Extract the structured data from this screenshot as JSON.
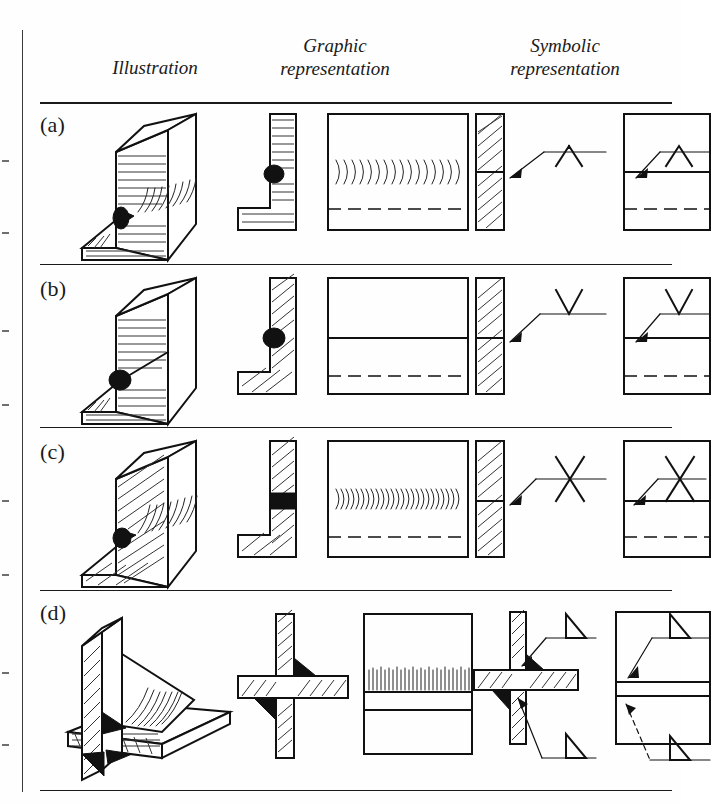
{
  "figure": {
    "kind": "welding-symbols-reference-table",
    "columns": [
      {
        "id": "illustration",
        "line1": "Illustration",
        "line2": ""
      },
      {
        "id": "graphic",
        "line1": "Graphic",
        "line2": "representation"
      },
      {
        "id": "symbolic",
        "line1": "Symbolic",
        "line2": "representation"
      }
    ],
    "rows": [
      {
        "id": "a",
        "label": "(a)",
        "joint": "T-joint single-bevel fillet weld",
        "illustration": {
          "type": "isometric-t-joint",
          "surface": "rippled",
          "weld_bead": "black-triangle",
          "hatching": "fine-horizontal"
        },
        "graphic": {
          "section": "L-section with black fillet",
          "front_view": "box with weld ripples and dashed hidden line",
          "ripples": true,
          "ripple_count": 16,
          "hidden_line": "dashed"
        },
        "symbolic": {
          "symbol": "caret-up",
          "symbol_name": "single-bevel-weld-symbol",
          "symbol_glyph": "Λ",
          "position": "above-reference-line",
          "leader": "arrow-to-joint",
          "views": [
            "section",
            "front"
          ]
        }
      },
      {
        "id": "b",
        "label": "(b)",
        "joint": "T-joint single-V butt weld, dressed flush",
        "illustration": {
          "type": "isometric-t-joint",
          "surface": "smooth",
          "weld_bead": "black-oval",
          "hatching": "fine-horizontal"
        },
        "graphic": {
          "section": "L-section with black weld",
          "front_view": "plain box with solid seam line and dashed hidden line",
          "ripples": false,
          "ripple_count": 0,
          "hidden_line": "dashed"
        },
        "symbolic": {
          "symbol": "vee",
          "symbol_name": "single-v-butt-weld-symbol",
          "symbol_glyph": "V",
          "position": "above-reference-line",
          "leader": "arrow-to-joint",
          "views": [
            "section",
            "front"
          ]
        }
      },
      {
        "id": "c",
        "label": "(c)",
        "joint": "T-joint double-V butt weld",
        "illustration": {
          "type": "isometric-t-joint",
          "surface": "rippled",
          "weld_bead": "black-wedge",
          "hatching": "coarse-diagonal"
        },
        "graphic": {
          "section": "L-section with black weld both sides",
          "front_view": "box with fine ripples and dashed hidden line",
          "ripples": true,
          "ripple_count": 24,
          "hidden_line": "dashed"
        },
        "symbolic": {
          "symbol": "cross",
          "symbol_name": "double-v-butt-weld-symbol",
          "symbol_glyph": "X",
          "position": "straddling-reference-line",
          "leader": "arrow-to-joint",
          "views": [
            "section",
            "front"
          ]
        }
      },
      {
        "id": "d",
        "label": "(d)",
        "joint": "Cruciform joint, double fillet weld",
        "illustration": {
          "type": "isometric-cruciform",
          "surface": "rippled",
          "weld_bead": "black-triangles-both-sides",
          "hatching": "coarse-diagonal"
        },
        "graphic": {
          "section": "cross-section with two black fillets",
          "front_view": "box with dense ripple band",
          "ripples": true,
          "ripple_count": 28,
          "hidden_line": "none"
        },
        "symbolic": {
          "symbol": "right-triangle-pair",
          "symbol_name": "fillet-weld-symbol",
          "symbol_glyph": "◥",
          "position": "above-and-below-reference-line",
          "leader": "two-arrows-to-joint",
          "views": [
            "section",
            "front"
          ]
        }
      }
    ],
    "colors": {
      "ink": "#111111",
      "paper": "#fefefe",
      "rule": "#1a1a1a",
      "hatch": "#333333"
    }
  }
}
